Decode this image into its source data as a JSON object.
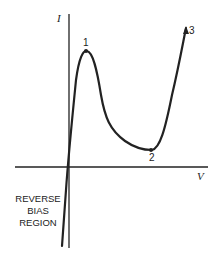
{
  "figure": {
    "axis_labels": {
      "y": "I",
      "x": "V"
    },
    "points": [
      {
        "id": "1",
        "label": "1",
        "description": "peak"
      },
      {
        "id": "2",
        "label": "2",
        "description": "valley"
      },
      {
        "id": "3",
        "label": "3",
        "description": "end of rising branch"
      }
    ],
    "region_label": [
      "REVERSE",
      "BIAS",
      "REGION"
    ],
    "colors": {
      "line": "#222222",
      "background": "#ffffff"
    }
  }
}
